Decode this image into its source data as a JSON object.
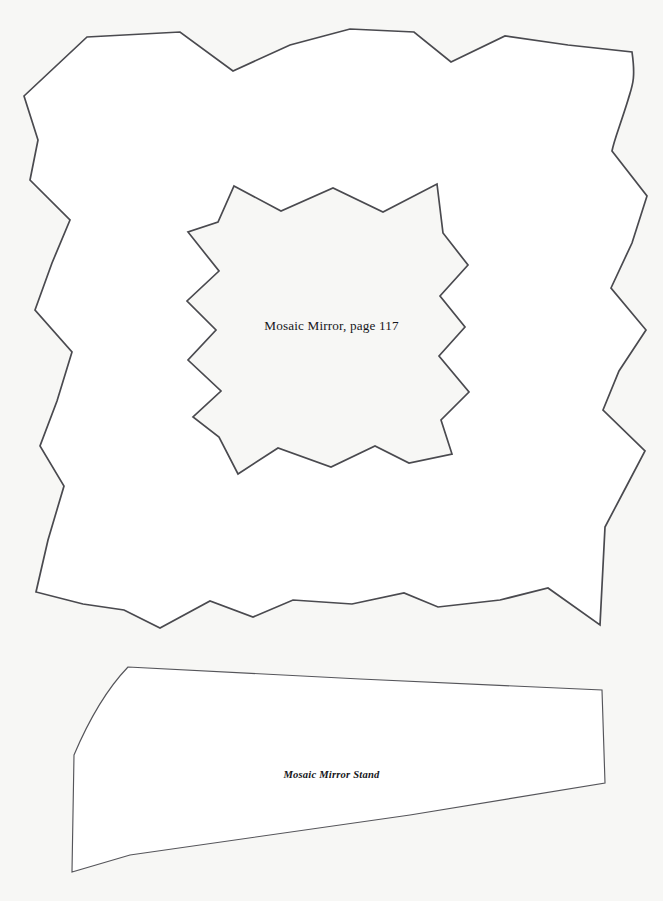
{
  "page": {
    "background_color": "#f7f7f5",
    "paper_color": "#ffffff",
    "outline_color": "#4a4a4f",
    "text_color": "#16161a",
    "width": 663,
    "height": 901
  },
  "patterns": [
    {
      "id": "mosaic-mirror-frame",
      "label": "Mosaic Mirror, page 117",
      "shape": "zigzag-star-frame-with-inner-star-cutout"
    },
    {
      "id": "mosaic-mirror-stand",
      "label": "Mosaic Mirror Stand",
      "shape": "tapered-quadrilateral-with-curved-left-edge"
    }
  ],
  "labels": {
    "mirror": "Mosaic Mirror, page 117",
    "stand": "Mosaic Mirror Stand"
  },
  "geometry": {
    "outer_frame_points": "24,96 87,37 180,32 233,71 290,45 350,29 414,32 451,62 505,36 568,45 632,52 628,100 612,151 647,196 632,243 611,288 646,330 619,371 603,410 645,451 625,489 605,527 600,625 548,588 500,600 438,607 404,593 352,604 293,600 253,617 210,601 160,628 124,610 83,604 36,592 48,540 64,486 40,446 57,401 72,352 35,310 52,263 70,220 30,180 38,140",
    "inner_star_points": "234,186 281,211 333,188 383,212 437,184 443,233 468,265 440,296 465,327 439,356 469,392 441,420 452,454 409,463 375,446 331,467 278,448 238,474 219,437 193,417 221,391 188,360 216,330 187,301 219,271 188,232 218,222",
    "stand_points": "128,667 360,679 602,690 605,783 410,815 130,855 72,872 74,755"
  }
}
